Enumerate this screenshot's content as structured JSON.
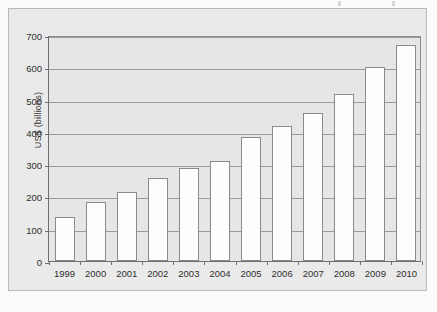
{
  "chart_data": {
    "type": "bar",
    "title": "",
    "xlabel": "",
    "ylabel": "US$ (billions)",
    "categories": [
      "1999",
      "2000",
      "2001",
      "2002",
      "2003",
      "2004",
      "2005",
      "2006",
      "2007",
      "2008",
      "2009",
      "2010"
    ],
    "values": [
      136,
      184,
      214,
      256,
      288,
      310,
      385,
      418,
      458,
      518,
      602,
      670
    ],
    "ylim": [
      0,
      700
    ],
    "yticks": [
      0,
      100,
      200,
      300,
      400,
      500,
      600,
      700
    ],
    "ytick_labels": [
      "0",
      "100",
      "200",
      "300",
      "400",
      "500",
      "600",
      "700"
    ],
    "grid": true,
    "legend": null,
    "legend_position": "none",
    "colors": {
      "bar_fill": "#fdfdfd",
      "bar_edge": "#8a8a8a",
      "plot_background": "#e6e6e6",
      "figure_background": "#eaeaea",
      "gridline": "#9a9a9a",
      "axis": "#6f6f6f",
      "text": "#2f2f2f"
    }
  }
}
